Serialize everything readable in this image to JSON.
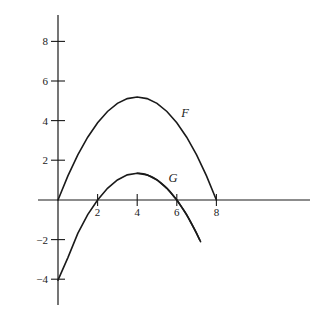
{
  "chart_data": {
    "type": "line",
    "title": "",
    "subtitle": "",
    "xlabel": "",
    "ylabel": "",
    "grid": false,
    "legend_position": "inline-curve-labels",
    "xlim": [
      -1.0,
      12.7
    ],
    "ylim": [
      -5.3,
      9.4
    ],
    "x_ticks": [
      2,
      4,
      6,
      8
    ],
    "x_tick_labels": [
      "2",
      "4",
      "6",
      "8"
    ],
    "y_ticks": [
      8,
      6,
      4,
      2,
      -2,
      -4
    ],
    "y_tick_labels": [
      "8",
      "6",
      "4",
      "2",
      "−2",
      "−4"
    ],
    "axes": {
      "x_axis_label": "x-axis",
      "y_axis_label": "y-axis",
      "origin_x": 0,
      "origin_y": 0,
      "color": "#1a1a1a"
    },
    "series": [
      {
        "name": "F",
        "label": "F",
        "label_x": 6.4,
        "label_y": 4.4,
        "color": "#1a1a1a",
        "equation": "F(x) = -0.325x^2 + 2.6x",
        "domain": [
          0,
          8
        ],
        "roots": [
          0,
          8
        ],
        "vertex": [
          4,
          5.2
        ],
        "x": [
          0,
          0.5,
          1,
          1.5,
          2,
          2.5,
          3,
          3.5,
          4,
          4.5,
          5,
          5.5,
          6,
          6.5,
          7,
          7.5,
          8
        ],
        "values": [
          0,
          1.22,
          2.28,
          3.17,
          3.9,
          4.47,
          4.88,
          5.12,
          5.2,
          5.12,
          4.88,
          4.47,
          3.9,
          3.17,
          2.28,
          1.22,
          0
        ]
      },
      {
        "name": "G",
        "label": "G",
        "label_x": 5.8,
        "label_y": 1.1,
        "color": "#1a1a1a",
        "equation": "G(x) = -0.3375(x - 4)^2 + 1.35",
        "domain": [
          0,
          7.15
        ],
        "roots": [
          2,
          6
        ],
        "vertex": [
          4,
          1.35
        ],
        "x": [
          0,
          0.5,
          1,
          1.5,
          2,
          2.5,
          3,
          3.5,
          4,
          4.5,
          5,
          5.5,
          6,
          6.5,
          7,
          7.15
        ],
        "values": [
          -4.05,
          -2.91,
          -1.69,
          -0.74,
          0,
          0.59,
          1.01,
          1.27,
          1.35,
          1.27,
          1.01,
          0.59,
          0,
          -0.74,
          -1.69,
          -2.0
        ]
      }
    ]
  },
  "labels": {
    "y_8": "8",
    "y_6": "6",
    "y_4": "4",
    "y_2": "2",
    "y_neg2": "−2",
    "y_neg4": "−4",
    "x_2": "2",
    "x_4": "4",
    "x_6": "6",
    "x_8": "8",
    "curve_f": "F",
    "curve_g": "G"
  },
  "colors": {
    "background": "#ffffff",
    "ink": "#1a1a1a",
    "curve": "#1a1a1a"
  }
}
